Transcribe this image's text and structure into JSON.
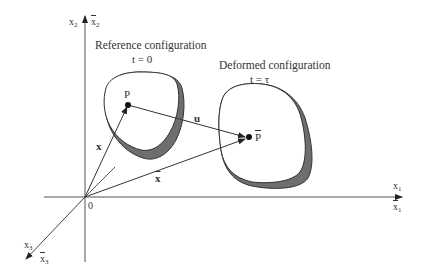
{
  "reference": {
    "title": "Reference configuration",
    "time": "t = 0",
    "point": "P"
  },
  "deformed": {
    "title": "Deformed configuration",
    "time": "t = τ",
    "point": "P"
  },
  "vectors": {
    "x": "x",
    "x_bar": "x",
    "u": "u"
  },
  "axes": {
    "origin": "0",
    "x1": {
      "base": "x",
      "sub": "1"
    },
    "x1_bar": {
      "base": "x",
      "sub": "1"
    },
    "x2": {
      "base": "x",
      "sub": "2"
    },
    "x2_bar": {
      "base": "x",
      "sub": "2"
    },
    "x3": {
      "base": "x",
      "sub": "3"
    },
    "x3_bar": {
      "base": "x",
      "sub": "3"
    }
  },
  "colors": {
    "line": "#333333",
    "shade": "#707070"
  }
}
